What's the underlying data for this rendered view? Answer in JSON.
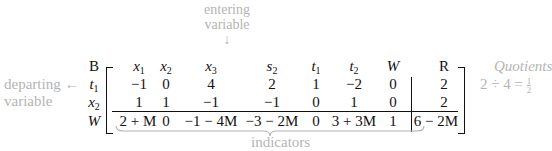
{
  "annotations": {
    "entering": [
      "entering",
      "variable"
    ],
    "entering_arrow": "↓",
    "departing": [
      "departing",
      "variable"
    ],
    "departing_arrow": "←",
    "quotients_title": "Quotients",
    "quotient_expr": "2 ÷ 4 = ",
    "quotient_num": "1",
    "quotient_den": "2",
    "indicators": "indicators"
  },
  "tableau": {
    "basis_header": "B",
    "columns": [
      {
        "base": "x",
        "sub": "1"
      },
      {
        "base": "x",
        "sub": "2"
      },
      {
        "base": "x",
        "sub": "3"
      },
      {
        "base": "s",
        "sub": "2"
      },
      {
        "base": "t",
        "sub": "1"
      },
      {
        "base": "t",
        "sub": "2"
      },
      {
        "base": "W",
        "sub": ""
      }
    ],
    "rhs_header": "R",
    "rows": [
      {
        "label": {
          "base": "t",
          "sub": "1"
        },
        "values": [
          "−1",
          "0",
          "4",
          "2",
          "1",
          "−2",
          "0"
        ],
        "rhs": "2"
      },
      {
        "label": {
          "base": "x",
          "sub": "2"
        },
        "values": [
          "1",
          "1",
          "−1",
          "−1",
          "0",
          "1",
          "0"
        ],
        "rhs": "2"
      },
      {
        "label": {
          "base": "W",
          "sub": ""
        },
        "values": [
          "2 + M",
          "0",
          "−1 − 4M",
          "−3 − 2M",
          "0",
          "3 + 3M",
          "1"
        ],
        "rhs": "6 − 2M"
      }
    ]
  }
}
